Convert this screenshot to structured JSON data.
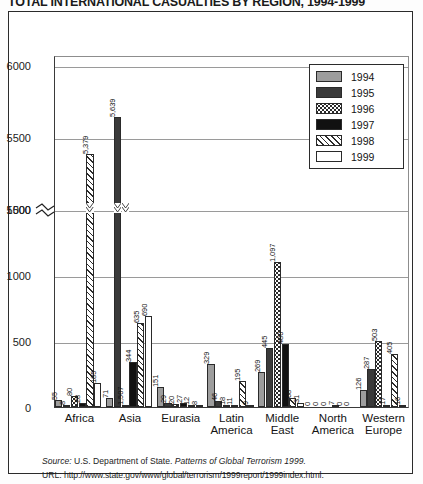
{
  "title": "TOTAL INTERNATIONAL CASUALTIES BY REGION, 1994-1999",
  "legend": {
    "entries": [
      {
        "label": "1994",
        "pattern": "solid-gray",
        "color": "#9d9d9d"
      },
      {
        "label": "1995",
        "pattern": "solid-dark",
        "color": "#3a3a3a"
      },
      {
        "label": "1996",
        "pattern": "dotted",
        "color": "#ffffff"
      },
      {
        "label": "1997",
        "pattern": "solid-black",
        "color": "#111111"
      },
      {
        "label": "1998",
        "pattern": "diagonal-hatch",
        "color": "#ffffff"
      },
      {
        "label": "1999",
        "pattern": "solid-white",
        "color": "#ffffff"
      }
    ]
  },
  "footer": {
    "source_label": "Source:",
    "source_text": "U.S. Department of State.",
    "source_italic": "Patterns of Global Terrorism 1999.",
    "url_label": "URL:",
    "url_text": "http://www.state.gov/www/global/terrorism/1999report/1999index.html."
  },
  "axis": {
    "y_ticks": [
      "0",
      "500",
      "1000",
      "1500",
      "5000",
      "5500",
      "6000"
    ],
    "break_marker": "≈",
    "y_max_label": "6000"
  },
  "chart_data": {
    "type": "bar",
    "title": "TOTAL INTERNATIONAL CASUALTIES BY REGION, 1994-1999",
    "xlabel": "",
    "ylabel": "",
    "grid": true,
    "legend_position": "top-right",
    "axis_break": {
      "lower_max": 1500,
      "upper_min": 5000,
      "note": "y-axis broken between 1500 and 5000"
    },
    "ylim": [
      0,
      6000
    ],
    "ytick_values": [
      0,
      500,
      1000,
      1500,
      5000,
      5500,
      6000
    ],
    "categories": [
      "Africa",
      "Asia",
      "Eurasia",
      "Latin America",
      "Middle East",
      "North America",
      "Western Europe"
    ],
    "series": [
      {
        "name": "1994",
        "values": [
          55,
          71,
          151,
          329,
          269,
          0,
          126
        ]
      },
      {
        "name": "1995",
        "values": [
          8,
          5639,
          29,
          46,
          445,
          0,
          287
        ]
      },
      {
        "name": "1996",
        "values": [
          80,
          1507,
          20,
          18,
          1097,
          0,
          503
        ]
      },
      {
        "name": "1997",
        "values": [
          28,
          344,
          27,
          11,
          480,
          7,
          17
        ]
      },
      {
        "name": "1998",
        "values": [
          5379,
          635,
          12,
          195,
          68,
          0,
          405
        ]
      },
      {
        "name": "1999",
        "values": [
          185,
          690,
          8,
          9,
          31,
          0,
          16
        ]
      }
    ],
    "data_labels": [
      {
        "category": "Africa",
        "labels": [
          "55",
          "8",
          "80",
          "28",
          "5,379",
          "185"
        ]
      },
      {
        "category": "Asia",
        "labels": [
          "71",
          "5,639",
          "1,507",
          "344",
          "635",
          "690"
        ]
      },
      {
        "category": "Eurasia",
        "labels": [
          "151",
          "29",
          "20",
          "27",
          "12",
          "8"
        ]
      },
      {
        "category": "Latin America",
        "labels": [
          "329",
          "46",
          "18",
          "11",
          "195",
          "9"
        ]
      },
      {
        "category": "Middle East",
        "labels": [
          "269",
          "445",
          "1,097",
          "480",
          "68",
          "31"
        ]
      },
      {
        "category": "North America",
        "labels": [
          "0",
          "0",
          "0",
          "7",
          "0",
          "0"
        ]
      },
      {
        "category": "Western Europe",
        "labels": [
          "126",
          "287",
          "503",
          "17",
          "405",
          "16"
        ]
      }
    ]
  },
  "xlabels": [
    {
      "line1": "Africa",
      "line2": ""
    },
    {
      "line1": "Asia",
      "line2": ""
    },
    {
      "line1": "Eurasia",
      "line2": ""
    },
    {
      "line1": "Latin",
      "line2": "America"
    },
    {
      "line1": "Middle",
      "line2": "East"
    },
    {
      "line1": "North",
      "line2": "America"
    },
    {
      "line1": "Western",
      "line2": "Europe"
    }
  ]
}
